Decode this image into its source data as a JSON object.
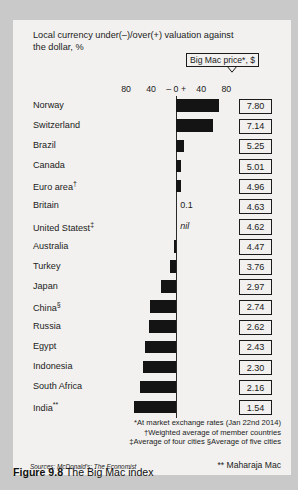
{
  "figure": {
    "number_label": "Figure 9.8",
    "caption": "The Big Mac index"
  },
  "chart_title": "Local currency under(–)/over(+) valuation against the dollar, %",
  "legend": {
    "price_column_label": "Big Mac price*, $"
  },
  "footnotes": [
    "*At market exchange rates (Jan 22nd 2014)",
    "†Weighted average of member countries",
    "‡Average of four cities   §Average of five cities"
  ],
  "sources_prefix": "Sources:",
  "sources_text": "McDonald's; The Economist",
  "maharaja_note": "** Maharaja Mac",
  "chart_data": {
    "type": "bar",
    "orientation": "horizontal",
    "title": "Local currency under(–)/over(+) valuation against the dollar, %",
    "xlabel": "",
    "ylabel": "",
    "xlim": [
      -80,
      80
    ],
    "xticks": [
      -80,
      -40,
      0,
      40,
      80
    ],
    "xtick_labels": [
      "80",
      "40",
      "–  0  +",
      "40",
      "80"
    ],
    "grid": false,
    "zero_axis": true,
    "categories": [
      "Norway",
      "Switzerland",
      "Brazil",
      "Canada",
      "Euro area†",
      "Britain",
      "United Statest‡",
      "Australia",
      "Turkey",
      "Japan",
      "China§",
      "Russia",
      "Egypt",
      "Indonesia",
      "South Africa",
      "India**"
    ],
    "values": [
      68,
      58,
      12,
      7,
      8,
      0.1,
      0,
      -3,
      -10,
      -24,
      -41,
      -44,
      -50,
      -53,
      -57,
      -67
    ],
    "value_annotations": {
      "Britain": "0.1",
      "United Statest‡": "nil"
    },
    "series": [
      {
        "name": "Local currency under(–)/over(+) valuation against the dollar, %",
        "values": [
          68,
          58,
          12,
          7,
          8,
          0.1,
          0,
          -3,
          -10,
          -24,
          -41,
          -44,
          -50,
          -53,
          -57,
          -67
        ]
      },
      {
        "name": "Big Mac price*, $",
        "values": [
          7.8,
          7.14,
          5.25,
          5.01,
          4.96,
          4.63,
          4.62,
          4.47,
          3.76,
          2.97,
          2.74,
          2.62,
          2.43,
          2.3,
          2.16,
          1.54
        ]
      }
    ],
    "rows": [
      {
        "country": "Norway",
        "sup": "",
        "value": 68,
        "price": "7.80",
        "annotation": ""
      },
      {
        "country": "Switzerland",
        "sup": "",
        "value": 58,
        "price": "7.14",
        "annotation": ""
      },
      {
        "country": "Brazil",
        "sup": "",
        "value": 12,
        "price": "5.25",
        "annotation": ""
      },
      {
        "country": "Canada",
        "sup": "",
        "value": 7,
        "price": "5.01",
        "annotation": ""
      },
      {
        "country": "Euro area",
        "sup": "†",
        "value": 8,
        "price": "4.96",
        "annotation": ""
      },
      {
        "country": "Britain",
        "sup": "",
        "value": 0.1,
        "price": "4.63",
        "annotation": "0.1"
      },
      {
        "country": "United Statest",
        "sup": "‡",
        "value": 0,
        "price": "4.62",
        "annotation": "nil"
      },
      {
        "country": "Australia",
        "sup": "",
        "value": -3,
        "price": "4.47",
        "annotation": ""
      },
      {
        "country": "Turkey",
        "sup": "",
        "value": -10,
        "price": "3.76",
        "annotation": ""
      },
      {
        "country": "Japan",
        "sup": "",
        "value": -24,
        "price": "2.97",
        "annotation": ""
      },
      {
        "country": "China",
        "sup": "§",
        "value": -41,
        "price": "2.74",
        "annotation": ""
      },
      {
        "country": "Russia",
        "sup": "",
        "value": -44,
        "price": "2.62",
        "annotation": ""
      },
      {
        "country": "Egypt",
        "sup": "",
        "value": -50,
        "price": "2.43",
        "annotation": ""
      },
      {
        "country": "Indonesia",
        "sup": "",
        "value": -53,
        "price": "2.30",
        "annotation": ""
      },
      {
        "country": "South Africa",
        "sup": "",
        "value": -57,
        "price": "2.16",
        "annotation": ""
      },
      {
        "country": "India",
        "sup": "**",
        "value": -67,
        "price": "1.54",
        "annotation": ""
      }
    ]
  },
  "colors": {
    "bar": "#141414",
    "panel_background": "#f2f1ef",
    "page_background": "#c9c9c9",
    "text": "#1b1b1b"
  }
}
